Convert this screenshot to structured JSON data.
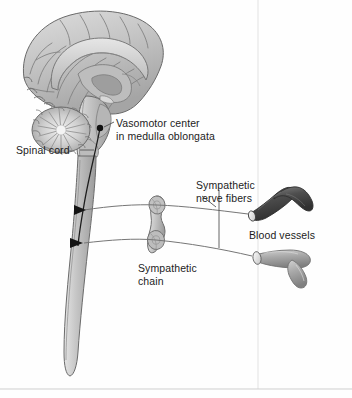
{
  "figure": {
    "type": "anatomical-diagram",
    "palette": {
      "brain_fill": "#c9c9c9",
      "brain_shadow": "#9a9a9a",
      "brain_light": "#e2e2e2",
      "outline": "#555555",
      "label_text": "#1c1c1c",
      "leader_line": "#6f6f6f",
      "vessel_constricted": "#5a5a5a",
      "vessel_dilated": "#a8a8a8",
      "border_line": "#d6d6d6",
      "page_background": "#ffffff"
    }
  },
  "labels": {
    "vasomotor_center": "Vasomotor center\nin medulla oblongata",
    "spinal_cord": "Spinal cord",
    "sympathetic_nerve_fibers": "Sympathetic\nnerve fibers",
    "blood_vessels": "Blood vessels",
    "sympathetic_chain": "Sympathetic\nchain"
  },
  "structures": [
    {
      "name": "cerebrum",
      "description": "midsagittal cerebral hemisphere with gyri and sulci"
    },
    {
      "name": "corpus-callosum",
      "description": "arched white matter band"
    },
    {
      "name": "cerebellum",
      "description": "arbor vitae radiating pattern"
    },
    {
      "name": "brainstem",
      "description": "midbrain, pons and medulla oblongata"
    },
    {
      "name": "medulla-oblongata",
      "description": "site of the vasomotor center"
    },
    {
      "name": "spinal-cord",
      "description": "long tapering cord descending from medulla"
    },
    {
      "name": "descending-tract",
      "description": "dark line from vasomotor center to cord outflow"
    },
    {
      "name": "sympathetic-chain",
      "description": "paired ganglia connected in a chain"
    },
    {
      "name": "sympathetic-chain-ganglion-upper",
      "description": "upper oval ganglion"
    },
    {
      "name": "sympathetic-chain-ganglion-lower",
      "description": "lower oval ganglion"
    },
    {
      "name": "nerve-fiber-upper",
      "description": "preganglionic and postganglionic fiber to constricted vessel"
    },
    {
      "name": "nerve-fiber-lower",
      "description": "preganglionic and postganglionic fiber to dilated vessel"
    },
    {
      "name": "blood-vessel-constricted",
      "description": "dark narrow branching vessel"
    },
    {
      "name": "blood-vessel-dilated",
      "description": "pale wide branching vessel"
    },
    {
      "name": "outflow-arrow-upper",
      "description": "arrowhead at cord where upper fiber exits"
    },
    {
      "name": "outflow-arrow-lower",
      "description": "arrowhead at cord where lower fiber exits"
    }
  ]
}
